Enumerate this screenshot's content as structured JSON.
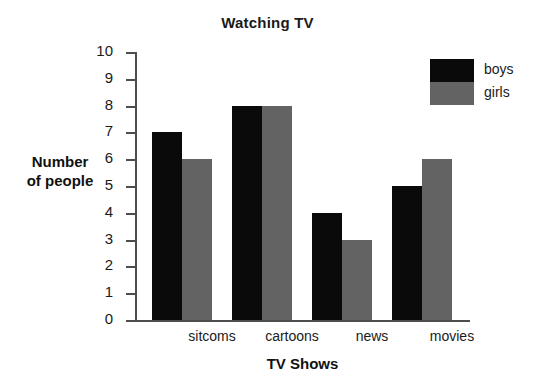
{
  "chart_data": {
    "type": "bar",
    "title": "Watching TV",
    "xlabel": "TV Shows",
    "ylabel_line1": "Number",
    "ylabel_line2": "of people",
    "ylabel": "Number of people",
    "categories": [
      "sitcoms",
      "cartoons",
      "news",
      "movies"
    ],
    "series": [
      {
        "name": "boys",
        "color": "#0a0a0a",
        "values": [
          7,
          8,
          4,
          5
        ]
      },
      {
        "name": "girls",
        "color": "#636363",
        "values": [
          6,
          8,
          3,
          6
        ]
      }
    ],
    "ylim": [
      0,
      10
    ],
    "yticks": [
      10,
      9,
      8,
      7,
      6,
      5,
      4,
      3,
      2,
      1,
      0
    ],
    "grid": false,
    "legend_position": "top-right"
  },
  "legend": {
    "entries": [
      {
        "label": "boys",
        "color": "#0a0a0a"
      },
      {
        "label": "girls",
        "color": "#636363"
      }
    ]
  }
}
